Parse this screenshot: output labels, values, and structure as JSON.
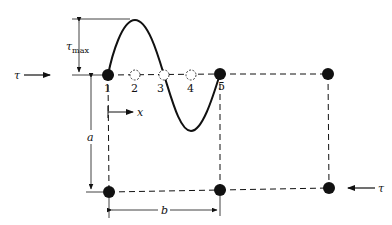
{
  "figure": {
    "type": "shear-stress-element-diagram",
    "colors": {
      "ink": "#111111",
      "background": "#ffffff"
    },
    "nodes": [
      {
        "id": "1",
        "label": "1",
        "x": 108,
        "y": 75,
        "style": "filled"
      },
      {
        "id": "2",
        "label": "2",
        "x": 135,
        "y": 75,
        "style": "open"
      },
      {
        "id": "3",
        "label": "3",
        "x": 164,
        "y": 75,
        "style": "open"
      },
      {
        "id": "4",
        "label": "4",
        "x": 191,
        "y": 75,
        "style": "open"
      },
      {
        "id": "5",
        "label": "5",
        "x": 220,
        "y": 74,
        "style": "filled"
      },
      {
        "id": "top-right",
        "label": "",
        "x": 328,
        "y": 74,
        "style": "filled"
      },
      {
        "id": "bottom-left",
        "label": "",
        "x": 109,
        "y": 192,
        "style": "filled"
      },
      {
        "id": "bottom-middle",
        "label": "",
        "x": 220,
        "y": 190,
        "style": "filled"
      },
      {
        "id": "bottom-right",
        "label": "",
        "x": 329,
        "y": 188,
        "style": "filled"
      }
    ],
    "labels": {
      "tau_left": "τ",
      "tau_right": "τ",
      "tau_max": "τ",
      "tau_max_sub": "max",
      "x_axis": "x",
      "dim_a": "a",
      "dim_b": "b"
    },
    "stress_curve": {
      "description": "stress distribution curve from node 1 to node 5",
      "peak": {
        "x": 135,
        "y": 20
      },
      "trough": {
        "x": 191,
        "y": 131
      }
    }
  }
}
